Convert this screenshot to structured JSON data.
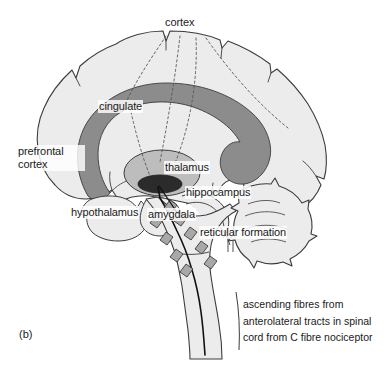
{
  "figure": {
    "panel_letter": "(b)",
    "background_color": "#ffffff",
    "ink_color": "#1a1a1a"
  },
  "colors": {
    "brain_fill": "#ececec",
    "brain_outline": "#3c3c3c",
    "cingulate_fill": "#8c8c8c",
    "thalamus_outer_fill": "#bdbdbd",
    "thalamus_inner_fill": "#2b2b2b",
    "reticular_marker_fill": "#a8a8a8",
    "leader_line_color": "#555555",
    "tract_line_color": "#111111"
  },
  "labels": {
    "cortex": "cortex",
    "cingulate": "cingulate",
    "prefrontal_cortex": "prefrontal\ncortex",
    "prefrontal_cortex_line1": "prefrontal",
    "prefrontal_cortex_line2": "cortex",
    "thalamus": "thalamus",
    "hippocampus": "hippocampus",
    "hypothalamus": "hypothalamus",
    "amygdala": "amygdala",
    "reticular_formation": "reticular formation"
  },
  "caption": {
    "line1": "ascending fibres from",
    "line2": "anterolateral tracts in spinal",
    "line3": "cord from C fibre nociceptor"
  },
  "structures": [
    {
      "name": "cortex",
      "type": "outline",
      "shading": "light-gray"
    },
    {
      "name": "cingulate",
      "type": "arc-band",
      "shading": "dark-gray"
    },
    {
      "name": "thalamus",
      "type": "ellipse",
      "shading": "mid-gray"
    },
    {
      "name": "thalamus-core",
      "type": "ellipse",
      "shading": "near-black"
    },
    {
      "name": "prefrontal cortex",
      "type": "region",
      "shading": "light-gray"
    },
    {
      "name": "hypothalamus",
      "type": "region",
      "shading": "light-gray"
    },
    {
      "name": "amygdala",
      "type": "region",
      "shading": "light-gray"
    },
    {
      "name": "hippocampus",
      "type": "region",
      "shading": "light-gray"
    },
    {
      "name": "reticular formation",
      "type": "diamond-markers",
      "shading": "mid-gray",
      "count": 9
    },
    {
      "name": "cerebellum",
      "type": "foliated-region",
      "shading": "light-gray"
    },
    {
      "name": "brainstem",
      "type": "region",
      "shading": "light-gray"
    }
  ],
  "leader_lines": {
    "style": "dotted",
    "from": "cortex",
    "targets": [
      "cingulate",
      "thalamus",
      "cortical surface points"
    ],
    "count": 5
  }
}
